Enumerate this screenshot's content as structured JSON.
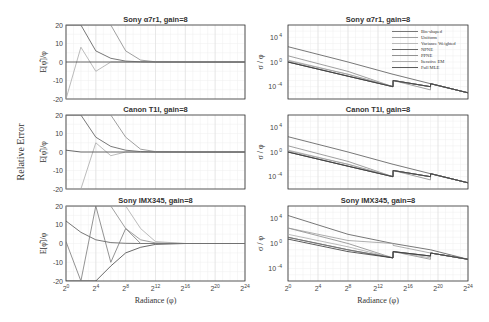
{
  "figure": {
    "shared_ylabel": "Relative Error",
    "left_ylabel": "E[φ̂]/φ",
    "right_ylabel": "σ / φ",
    "xlabel": "Radiance (φ)",
    "panel_titles": [
      "Sony  α7r1, gain=8",
      "Canon T1I, gain=8",
      "Sony IMX345, gain=8"
    ],
    "left_yticks": [
      "20",
      "10",
      "0",
      "-10",
      "-20"
    ],
    "right_yticks": [
      {
        "base": "10",
        "exp": "4"
      },
      {
        "base": "10",
        "exp": "0"
      },
      {
        "base": "10",
        "exp": "-4"
      }
    ],
    "xticks": [
      {
        "base": "2",
        "exp": "0"
      },
      {
        "base": "2",
        "exp": "4"
      },
      {
        "base": "2",
        "exp": "8"
      },
      {
        "base": "2",
        "exp": "12"
      },
      {
        "base": "2",
        "exp": "16"
      },
      {
        "base": "2",
        "exp": "20"
      },
      {
        "base": "2",
        "exp": "24"
      }
    ],
    "legend": [
      "Bin-shaped",
      "Uniform",
      "Variance Weighted",
      "NPNE",
      "PPNE",
      "Iterative EM",
      "Full MLE"
    ]
  },
  "chart_data": [
    {
      "type": "line",
      "title": "Sony  α7r1, gain=8",
      "xlabel": "Radiance (φ)",
      "ylabel": "E[φ̂]/φ",
      "x_log2": [
        0,
        2,
        4,
        6,
        8,
        10,
        12,
        16,
        20,
        24
      ],
      "ylim": [
        -20,
        20
      ],
      "xscale": "log2",
      "xlim_log2": [
        0,
        24
      ],
      "grid": true,
      "series": [
        {
          "name": "decay-A",
          "values": [
            20,
            20,
            6,
            2,
            0.5,
            0.1,
            0,
            0,
            0,
            0
          ]
        },
        {
          "name": "decay-B",
          "values": [
            20,
            20,
            20,
            20,
            6,
            1,
            0.1,
            0,
            0,
            0
          ]
        },
        {
          "name": "oscillating",
          "values": [
            -20,
            8,
            -5,
            0,
            0,
            0,
            0,
            0,
            0,
            0
          ]
        },
        {
          "name": "flat",
          "values": [
            0,
            0,
            0,
            0,
            0,
            0,
            0,
            0,
            0,
            0
          ]
        }
      ]
    },
    {
      "type": "line",
      "title": "Sony  α7r1, gain=8",
      "xlabel": "Radiance (φ)",
      "ylabel": "σ / φ",
      "yscale": "log10",
      "ylim": [
        1e-06,
        1000000.0
      ],
      "xscale": "log2",
      "xlim_log2": [
        0,
        24
      ],
      "grid": true,
      "legend": [
        "Bin-shaped",
        "Uniform",
        "Variance Weighted",
        "NPNE",
        "PPNE",
        "Iterative EM",
        "Full MLE"
      ],
      "legend_position": "upper right",
      "x_log2": [
        0,
        8,
        14,
        14.01,
        19,
        19.01,
        24
      ],
      "series": [
        {
          "name": "Bin-shaped",
          "values": [
            300,
            1,
            0.01,
            0.01,
            0.0003,
            0.0003,
            1e-05
          ]
        },
        {
          "name": "Uniform",
          "values": [
            10,
            0.03,
            0.0001,
            0.001,
            3e-05,
            0.0003,
            1e-05
          ]
        },
        {
          "name": "Variance Weighted",
          "values": [
            2,
            0.01,
            0.0001,
            0.001,
            0.0001,
            0.0003,
            1e-05
          ]
        },
        {
          "name": "NPNE",
          "values": [
            1,
            0.005,
            0.0001,
            0.001,
            0.0001,
            0.0003,
            1e-05
          ]
        },
        {
          "name": "PPNE",
          "values": [
            1,
            0.005,
            0.0001,
            0.001,
            0.0001,
            0.0003,
            1e-05
          ]
        },
        {
          "name": "Iterative EM",
          "values": [
            1.5,
            0.01,
            0.0001,
            0.001,
            0.0001,
            0.0003,
            1e-05
          ]
        },
        {
          "name": "Full MLE",
          "values": [
            1,
            0.005,
            0.0001,
            0.001,
            0.0001,
            0.0003,
            1e-05
          ]
        }
      ]
    },
    {
      "type": "line",
      "title": "Canon T1I, gain=8",
      "xlabel": "Radiance (φ)",
      "ylabel": "E[φ̂]/φ",
      "x_log2": [
        0,
        2,
        4,
        6,
        8,
        10,
        12,
        16,
        20,
        24
      ],
      "ylim": [
        -20,
        20
      ],
      "xscale": "log2",
      "xlim_log2": [
        0,
        24
      ],
      "grid": true,
      "series": [
        {
          "name": "decay-A",
          "values": [
            20,
            20,
            8,
            3,
            1,
            0.2,
            0,
            0,
            0,
            0
          ]
        },
        {
          "name": "decay-B",
          "values": [
            20,
            20,
            20,
            20,
            8,
            1.5,
            0.2,
            0,
            0,
            0
          ]
        },
        {
          "name": "oscillating",
          "values": [
            -20,
            -20,
            5,
            -2,
            0,
            0,
            0,
            0,
            0,
            0
          ]
        },
        {
          "name": "flat",
          "values": [
            1,
            0,
            0,
            0,
            0,
            0,
            0,
            0,
            0,
            0
          ]
        }
      ]
    },
    {
      "type": "line",
      "title": "Canon T1I, gain=8",
      "xlabel": "Radiance (φ)",
      "ylabel": "σ / φ",
      "yscale": "log10",
      "ylim": [
        1e-06,
        1000000.0
      ],
      "xscale": "log2",
      "xlim_log2": [
        0,
        24
      ],
      "grid": true,
      "x_log2": [
        0,
        8,
        14,
        14.01,
        19,
        19.01,
        24
      ],
      "series": [
        {
          "name": "Bin-shaped",
          "values": [
            300,
            1,
            0.01,
            0.01,
            0.0003,
            0.0003,
            1e-05
          ]
        },
        {
          "name": "Uniform",
          "values": [
            10,
            0.03,
            0.0001,
            0.001,
            3e-05,
            0.0003,
            1e-05
          ]
        },
        {
          "name": "Variance Weighted",
          "values": [
            2,
            0.01,
            0.0001,
            0.001,
            0.0001,
            0.0003,
            1e-05
          ]
        },
        {
          "name": "NPNE",
          "values": [
            1,
            0.005,
            0.0001,
            0.001,
            0.0001,
            0.0003,
            1e-05
          ]
        },
        {
          "name": "PPNE",
          "values": [
            1,
            0.005,
            0.0001,
            0.001,
            0.0001,
            0.0003,
            1e-05
          ]
        },
        {
          "name": "Iterative EM",
          "values": [
            1.5,
            0.01,
            0.0001,
            0.001,
            0.0001,
            0.0003,
            1e-05
          ]
        },
        {
          "name": "Full MLE",
          "values": [
            1,
            0.005,
            0.0001,
            0.001,
            0.0001,
            0.0003,
            1e-05
          ]
        }
      ]
    },
    {
      "type": "line",
      "title": "Sony IMX345, gain=8",
      "xlabel": "Radiance (φ)",
      "ylabel": "E[φ̂]/φ",
      "x_log2": [
        0,
        2,
        4,
        6,
        8,
        10,
        12,
        16,
        20,
        24
      ],
      "ylim": [
        -20,
        20
      ],
      "xscale": "log2",
      "xlim_log2": [
        0,
        24
      ],
      "grid": true,
      "series": [
        {
          "name": "decay-A",
          "values": [
            12,
            6,
            2,
            0.5,
            0.1,
            0,
            0,
            0,
            0,
            0
          ]
        },
        {
          "name": "decay-B",
          "values": [
            20,
            20,
            20,
            20,
            8,
            2,
            0.3,
            0,
            0,
            0
          ]
        },
        {
          "name": "decay-C",
          "values": [
            20,
            20,
            20,
            20,
            20,
            8,
            1,
            0,
            0,
            0
          ]
        },
        {
          "name": "negative",
          "values": [
            -20,
            -20,
            -20,
            -12,
            -5,
            -2,
            -0.5,
            0,
            0,
            0
          ]
        },
        {
          "name": "oscillating",
          "values": [
            1,
            -20,
            20,
            -10,
            8,
            0,
            0,
            0,
            0,
            0
          ]
        }
      ]
    },
    {
      "type": "line",
      "title": "Sony IMX345, gain=8",
      "xlabel": "Radiance (φ)",
      "ylabel": "σ / φ",
      "yscale": "log10",
      "ylim": [
        1e-06,
        1000000.0
      ],
      "xscale": "log2",
      "xlim_log2": [
        0,
        24
      ],
      "grid": true,
      "x_log2": [
        0,
        8,
        14,
        14.01,
        19,
        19.01,
        24
      ],
      "series": [
        {
          "name": "Bin-shaped",
          "values": [
            30000,
            30,
            1,
            1,
            0.1,
            0.1,
            0.003
          ]
        },
        {
          "name": "Uniform",
          "values": [
            300,
            1,
            0.005,
            0.05,
            0.003,
            0.03,
            0.003
          ]
        },
        {
          "name": "Variance Weighted",
          "values": [
            30,
            0.3,
            0.005,
            0.05,
            0.005,
            0.03,
            0.003
          ]
        },
        {
          "name": "NPNE",
          "values": [
            10,
            0.1,
            0.005,
            0.05,
            0.01,
            0.03,
            0.003
          ]
        },
        {
          "name": "PPNE",
          "values": [
            10,
            0.1,
            0.005,
            0.05,
            0.01,
            0.03,
            0.003
          ]
        },
        {
          "name": "Iterative EM",
          "values": [
            300,
            3,
            1,
            0.5,
            0.03,
            0.03,
            0.003
          ]
        },
        {
          "name": "Full MLE",
          "values": [
            5,
            0.05,
            0.005,
            0.05,
            0.01,
            0.03,
            0.003
          ]
        }
      ]
    }
  ]
}
